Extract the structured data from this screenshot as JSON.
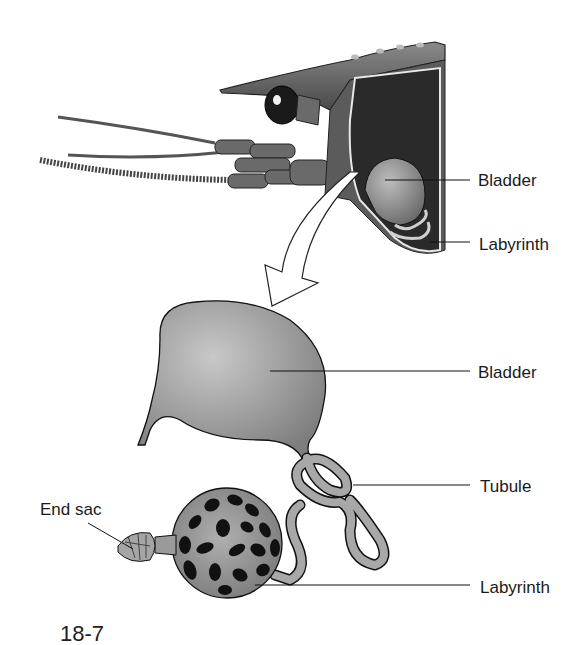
{
  "diagram": {
    "panels": [
      {
        "name": "head-cutaway",
        "labels": [
          {
            "id": "bladder",
            "text": "Bladder"
          },
          {
            "id": "labyrinth",
            "text": "Labyrinth"
          }
        ]
      },
      {
        "name": "enlarged-gland",
        "labels": [
          {
            "id": "bladder",
            "text": "Bladder"
          },
          {
            "id": "tubule",
            "text": "Tubule"
          },
          {
            "id": "end_sac",
            "text": "End sac"
          },
          {
            "id": "labyrinth",
            "text": "Labyrinth"
          }
        ]
      }
    ],
    "caption_fragment": "18-7",
    "colors": {
      "organ_fill": "#9a9a9a",
      "outline": "#1a1a1a",
      "dark_interior": "#2a2a2a",
      "labyrinth_spots": "#111111",
      "background": "#ffffff"
    }
  }
}
